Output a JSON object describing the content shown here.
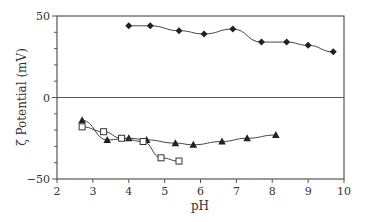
{
  "chart_data": {
    "type": "line",
    "title": "",
    "xlabel": "pH",
    "ylabel": "ζ Potential (mV)",
    "xlim": [
      2,
      10
    ],
    "ylim": [
      -50,
      50
    ],
    "x_ticks": [
      "2",
      "3",
      "4",
      "5",
      "6",
      "7",
      "8",
      "9",
      "10"
    ],
    "y_ticks": [
      "50",
      "0",
      "−50"
    ],
    "grid": false,
    "legend": null,
    "series": [
      {
        "name": "filled diamonds",
        "marker": "diamond-filled",
        "x": [
          4.0,
          4.6,
          5.4,
          6.1,
          6.9,
          7.7,
          8.4,
          9.0,
          9.7
        ],
        "y": [
          44,
          44,
          41,
          39,
          42,
          34,
          34,
          32,
          28
        ]
      },
      {
        "name": "filled triangles",
        "marker": "triangle-filled",
        "x": [
          2.7,
          3.4,
          4.0,
          4.5,
          5.3,
          5.8,
          6.6,
          7.3,
          8.1
        ],
        "y": [
          -14,
          -26,
          -25,
          -26,
          -28,
          -29,
          -27,
          -25,
          -23
        ]
      },
      {
        "name": "open squares",
        "marker": "square-open",
        "x": [
          2.7,
          3.3,
          3.8,
          4.4,
          4.9,
          5.4
        ],
        "y": [
          -18,
          -21,
          -25,
          -27,
          -37,
          -39
        ]
      }
    ]
  }
}
